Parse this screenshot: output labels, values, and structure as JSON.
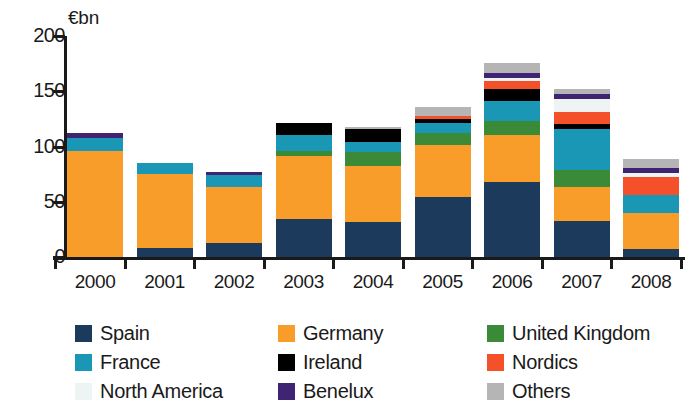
{
  "chart_data": {
    "type": "bar",
    "subtype": "stacked-bar",
    "title": "",
    "subtitle": "",
    "unit_label": "€bn",
    "xlabel": "",
    "ylabel": "",
    "ylim": [
      0,
      200
    ],
    "yticks": [
      0,
      50,
      100,
      150,
      200
    ],
    "ytick_labels": [
      "0",
      "50",
      "100",
      "150",
      "200"
    ],
    "grid": false,
    "legend_position": "bottom",
    "categories": [
      "2000",
      "2001",
      "2002",
      "2003",
      "2004",
      "2005",
      "2006",
      "2007",
      "2008"
    ],
    "series": [
      {
        "name": "Spain",
        "color": "#1b3a5c",
        "values": [
          0,
          8,
          13,
          34,
          32,
          54,
          68,
          33,
          7
        ]
      },
      {
        "name": "Germany",
        "color": "#f89c2a",
        "values": [
          96,
          67,
          50,
          57,
          50,
          47,
          42,
          30,
          33
        ]
      },
      {
        "name": "United Kingdom",
        "color": "#3b8a38",
        "values": [
          0,
          0,
          0,
          5,
          13,
          11,
          13,
          16,
          0
        ]
      },
      {
        "name": "France",
        "color": "#1a97b5",
        "values": [
          12,
          10,
          11,
          14,
          9,
          9,
          18,
          37,
          16
        ]
      },
      {
        "name": "Ireland",
        "color": "#000000",
        "values": [
          0,
          0,
          0,
          11,
          12,
          4,
          11,
          4,
          0
        ]
      },
      {
        "name": "Nordics",
        "color": "#f4502a",
        "values": [
          0,
          0,
          0,
          0,
          0,
          3,
          7,
          11,
          16
        ]
      },
      {
        "name": "North America",
        "color": "#eef3f4",
        "values": [
          0,
          0,
          0,
          0,
          0,
          0,
          3,
          12,
          4
        ]
      },
      {
        "name": "Benelux",
        "color": "#3e2472",
        "values": [
          4,
          0,
          3,
          0,
          0,
          0,
          5,
          5,
          5
        ]
      },
      {
        "name": "Others",
        "color": "#b5b5b5",
        "values": [
          0,
          0,
          0,
          0,
          2,
          8,
          9,
          4,
          8
        ]
      }
    ],
    "totals": [
      112,
      85,
      77,
      121,
      118,
      136,
      176,
      152,
      89
    ]
  },
  "legend": {
    "items": [
      {
        "label": "Spain",
        "color": "#1b3a5c",
        "col": 0,
        "row": 0
      },
      {
        "label": "France",
        "color": "#1a97b5",
        "col": 0,
        "row": 1
      },
      {
        "label": "North America",
        "color": "#eef3f4",
        "col": 0,
        "row": 2
      },
      {
        "label": "Germany",
        "color": "#f89c2a",
        "col": 1,
        "row": 0
      },
      {
        "label": "Ireland",
        "color": "#000000",
        "col": 1,
        "row": 1
      },
      {
        "label": "Benelux",
        "color": "#3e2472",
        "col": 1,
        "row": 2
      },
      {
        "label": "United Kingdom",
        "color": "#3b8a38",
        "col": 2,
        "row": 0
      },
      {
        "label": "Nordics",
        "color": "#f4502a",
        "col": 2,
        "row": 1
      },
      {
        "label": "Others",
        "color": "#b5b5b5",
        "col": 2,
        "row": 2
      }
    ]
  },
  "axis": {
    "unit_label": "€bn"
  }
}
